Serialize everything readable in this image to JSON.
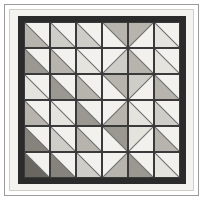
{
  "artwork": {
    "title": "Chevron Half-Square-Triangle Quilt",
    "kind": "quilt-block-diagram",
    "grid_rows": 6,
    "grid_cols": 6,
    "block_type": "half-square-triangle"
  },
  "palette": {
    "background": "#ffffff",
    "outer_rule": "#9a9a9a",
    "inner_mat": "#f4f3ef",
    "mat_edge": "#cfcfc9",
    "dark_frame": "#2b2b2b",
    "seam_line": "#6d6d6d",
    "light": "#f2f1ee",
    "pale": "#e4e3de",
    "mid_light": "#cfcdc7",
    "mid": "#b6b4ad",
    "mid_dark": "#9b9892",
    "dark": "#86837d",
    "darkest": "#6a6761"
  },
  "blocks": [
    [
      {
        "dir": "bl",
        "tone": "mid"
      },
      {
        "dir": "bl",
        "tone": "mid_light"
      },
      {
        "dir": "bl",
        "tone": "mid_light"
      },
      {
        "dir": "tr",
        "tone": "mid"
      },
      {
        "dir": "tl",
        "tone": "mid"
      },
      {
        "dir": "bl",
        "tone": "pale"
      }
    ],
    [
      {
        "dir": "bl",
        "tone": "mid_dark"
      },
      {
        "dir": "bl",
        "tone": "mid"
      },
      {
        "dir": "bl",
        "tone": "pale"
      },
      {
        "dir": "br",
        "tone": "mid_light"
      },
      {
        "dir": "bl",
        "tone": "mid"
      },
      {
        "dir": "bl",
        "tone": "pale"
      }
    ],
    [
      {
        "dir": "bl",
        "tone": "pale"
      },
      {
        "dir": "bl",
        "tone": "mid_dark"
      },
      {
        "dir": "bl",
        "tone": "mid"
      },
      {
        "dir": "tr",
        "tone": "mid"
      },
      {
        "dir": "tl",
        "tone": "mid_light"
      },
      {
        "dir": "bl",
        "tone": "mid"
      }
    ],
    [
      {
        "dir": "bl",
        "tone": "mid"
      },
      {
        "dir": "bl",
        "tone": "pale"
      },
      {
        "dir": "bl",
        "tone": "mid_dark"
      },
      {
        "dir": "br",
        "tone": "mid"
      },
      {
        "dir": "bl",
        "tone": "pale"
      },
      {
        "dir": "bl",
        "tone": "mid_light"
      }
    ],
    [
      {
        "dir": "bl",
        "tone": "dark"
      },
      {
        "dir": "bl",
        "tone": "mid_light"
      },
      {
        "dir": "bl",
        "tone": "mid"
      },
      {
        "dir": "tr",
        "tone": "mid_dark"
      },
      {
        "dir": "tl",
        "tone": "pale"
      },
      {
        "dir": "bl",
        "tone": "mid"
      }
    ],
    [
      {
        "dir": "bl",
        "tone": "darkest"
      },
      {
        "dir": "bl",
        "tone": "dark"
      },
      {
        "dir": "bl",
        "tone": "mid_light"
      },
      {
        "dir": "br",
        "tone": "mid"
      },
      {
        "dir": "bl",
        "tone": "mid_dark"
      },
      {
        "dir": "bl",
        "tone": "pale"
      }
    ]
  ]
}
